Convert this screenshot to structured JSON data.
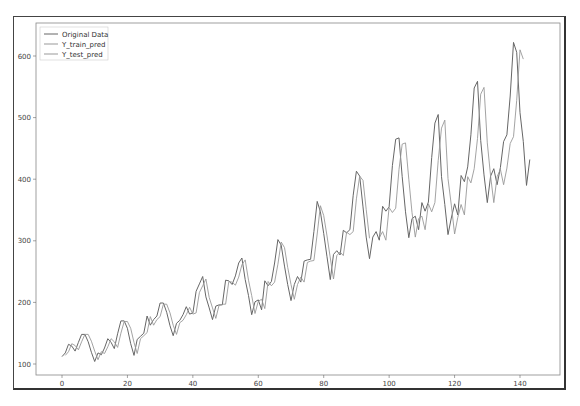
{
  "chart_data": {
    "type": "line",
    "title": "",
    "xlabel": "",
    "ylabel": "",
    "xlim": [
      -7,
      150
    ],
    "ylim": [
      75,
      655
    ],
    "xticks": [
      0,
      20,
      40,
      60,
      80,
      100,
      120,
      140
    ],
    "yticks": [
      100,
      200,
      300,
      400,
      500,
      600
    ],
    "grid": false,
    "legend_position": "upper left",
    "legend": [
      "Original Data",
      "Y_train_pred",
      "Y_test_pred"
    ],
    "series": [
      {
        "name": "Original Data",
        "color": "#666666",
        "x_start": 0,
        "values": [
          112,
          118,
          132,
          129,
          121,
          135,
          148,
          148,
          136,
          119,
          104,
          118,
          115,
          126,
          141,
          135,
          125,
          149,
          170,
          170,
          158,
          133,
          114,
          140,
          145,
          150,
          178,
          163,
          172,
          178,
          199,
          199,
          184,
          162,
          146,
          166,
          171,
          180,
          193,
          181,
          183,
          218,
          230,
          242,
          209,
          191,
          172,
          194,
          196,
          196,
          236,
          235,
          229,
          243,
          264,
          272,
          237,
          211,
          180,
          201,
          204,
          188,
          235,
          227,
          234,
          264,
          302,
          293,
          259,
          229,
          203,
          229,
          242,
          233,
          267,
          269,
          270,
          315,
          364,
          347,
          312,
          274,
          237,
          278,
          284,
          277,
          317,
          313,
          318,
          374,
          413,
          405,
          355,
          306,
          271,
          306,
          315,
          301,
          356,
          348,
          355,
          422,
          465,
          467,
          404,
          347,
          305,
          336,
          340,
          318,
          362,
          348,
          363,
          435,
          491,
          505,
          404,
          359,
          310,
          337,
          360,
          342,
          406,
          396,
          420,
          472,
          548,
          559,
          463,
          407,
          362,
          405,
          417,
          391,
          419,
          461,
          472,
          535,
          622,
          606,
          508,
          461,
          390,
          432
        ]
      },
      {
        "name": "Y_train_pred",
        "color": "#999999",
        "x_start": 1,
        "values": [
          114,
          120,
          133,
          130,
          123,
          136,
          148,
          148,
          137,
          121,
          107,
          120,
          117,
          128,
          141,
          136,
          127,
          150,
          169,
          169,
          158,
          135,
          117,
          141,
          146,
          151,
          177,
          163,
          172,
          177,
          197,
          197,
          183,
          163,
          148,
          167,
          171,
          180,
          192,
          181,
          183,
          216,
          227,
          238,
          208,
          191,
          174,
          195,
          197,
          197,
          234,
          233,
          228,
          241,
          261,
          269,
          236,
          211,
          182,
          202,
          205,
          190,
          234,
          227,
          233,
          262,
          298,
          289,
          257,
          229,
          205,
          229,
          241,
          233,
          265,
          267,
          268,
          311,
          357,
          341,
          308,
          272,
          238,
          276,
          282,
          276,
          314,
          310,
          315,
          368,
          405,
          398,
          351,
          304
        ]
      },
      {
        "name": "Y_test_pred",
        "color": "#999999",
        "x_start": 97,
        "values": [
          305,
          315,
          301,
          354,
          346,
          353,
          416,
          457,
          459,
          400,
          346,
          306,
          336,
          340,
          318,
          360,
          347,
          362,
          430,
          483,
          496,
          401,
          358,
          311,
          338,
          359,
          342,
          404,
          394,
          417,
          466,
          538,
          549,
          459,
          405,
          362,
          404,
          416,
          391,
          418,
          458,
          469,
          528,
          610,
          595
        ]
      }
    ]
  },
  "legend": {
    "items": [
      {
        "label": "Original Data"
      },
      {
        "label": "Y_train_pred"
      },
      {
        "label": "Y_test_pred"
      }
    ]
  }
}
